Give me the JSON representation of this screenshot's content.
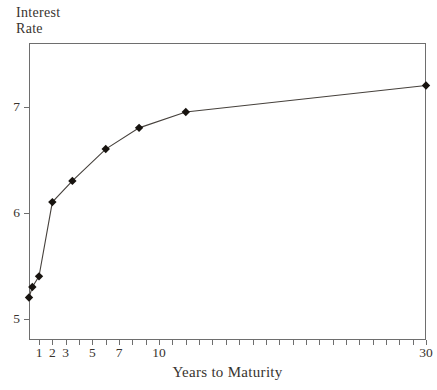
{
  "chart_data": {
    "type": "line",
    "title": "",
    "xlabel": "Years to Maturity",
    "ylabel": "Interest Rate",
    "x": [
      0.25,
      0.5,
      1,
      2,
      3.5,
      6,
      8.5,
      12,
      30
    ],
    "y": [
      5.2,
      5.3,
      5.4,
      6.1,
      6.3,
      6.6,
      6.8,
      6.95,
      7.2
    ],
    "xlim": [
      0.25,
      30
    ],
    "ylim": [
      4.8,
      7.6
    ],
    "x_major_ticks": [
      1,
      2,
      3,
      5,
      7,
      10,
      30
    ],
    "x_minor_tick_step": 1,
    "y_ticks": [
      5,
      6,
      7
    ],
    "marker": "diamond",
    "grid": false,
    "legend": null,
    "colors": {
      "background": "#ffffff",
      "frame": "#6e6e6e",
      "tick": "#6e6e6e",
      "line": "#46413c",
      "marker": "#17130f",
      "text": "#38332e"
    }
  }
}
